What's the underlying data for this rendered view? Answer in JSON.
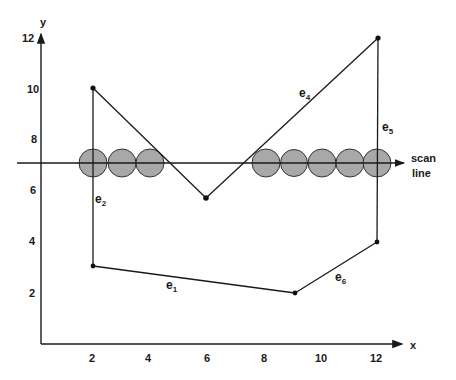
{
  "diagram": {
    "title": "",
    "axes": {
      "x_label": "x",
      "y_label": "y",
      "x_ticks": [
        "2",
        "4",
        "6",
        "8",
        "10",
        "12"
      ],
      "y_ticks": [
        "2",
        "4",
        "6",
        "8",
        "10",
        "12"
      ]
    },
    "scan_line": {
      "label_line1": "scan",
      "label_line2": "line",
      "y_value": 7
    },
    "polygon": {
      "vertices": [
        {
          "x": 2,
          "y": 10
        },
        {
          "x": 6,
          "y": 5.8
        },
        {
          "x": 12,
          "y": 12
        },
        {
          "x": 12,
          "y": 4
        },
        {
          "x": 9,
          "y": 2
        },
        {
          "x": 2,
          "y": 3
        }
      ],
      "edges": [
        {
          "name": "e",
          "sub": "1",
          "from": "(2,3)",
          "to": "(9,2)"
        },
        {
          "name": "e",
          "sub": "2",
          "from": "(2,3)",
          "to": "(2,10)"
        },
        {
          "name": "e",
          "sub": "4",
          "from": "(6,5.8)",
          "to": "(12,12)"
        },
        {
          "name": "e",
          "sub": "5",
          "from": "(12,12)",
          "to": "(12,4)"
        },
        {
          "name": "e",
          "sub": "6",
          "from": "(9,2)",
          "to": "(12,4)"
        }
      ]
    },
    "pixel_spans": {
      "left_run": [
        2,
        3,
        4
      ],
      "right_run": [
        8,
        9,
        10,
        11,
        12
      ]
    },
    "colors": {
      "line": "#1a1a1a",
      "pixel_fill": "#a8a8a8",
      "background": "#ffffff"
    }
  }
}
